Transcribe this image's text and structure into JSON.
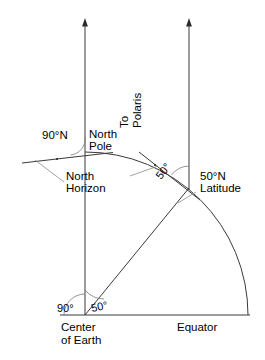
{
  "figure": {
    "background_color": "#ffffff",
    "line_color": "#3a3a3a",
    "thin_line_color": "#7a7a7a",
    "text_color": "#000000"
  },
  "labels": {
    "to_polaris": "To\nPolaris",
    "to_polaris_line1": "To",
    "to_polaris_line2": "Polaris",
    "pole_latitude": "90°N",
    "north_pole_line1": "North",
    "north_pole_line2": "Pole",
    "north_horizon_line1": "North",
    "north_horizon_line2": "Horizon",
    "latitude_50_line1": "50°N",
    "latitude_50_line2": "Latitude",
    "tangent_angle": "50°",
    "center_angle_right": "90°",
    "center_angle_left": "50°",
    "center_of_earth_line1": "Center",
    "center_of_earth_line2": "of Earth",
    "equator": "Equator"
  },
  "geometry": {
    "center_of_earth": {
      "x": 85,
      "y": 315
    },
    "earth_radius": 163,
    "pole_point": {
      "x": 85,
      "y": 152
    },
    "latitude_point": {
      "x": 189,
      "y": 188
    },
    "equator_point": {
      "x": 248,
      "y": 315
    },
    "latitude_degrees": 50,
    "pole_degrees": 90,
    "polar_axis_x": 85,
    "polaris_ray_x": 189,
    "equator_line_y": 315,
    "equator_line_x1": 60,
    "equator_line_x2": 250,
    "axis_top_y": 20
  },
  "annotations": {
    "angle_at_center_to_equator": "90°",
    "angle_latitude_at_center": "50°",
    "angle_polaris_altitude": "50°",
    "pole_altitude": "90°N"
  }
}
